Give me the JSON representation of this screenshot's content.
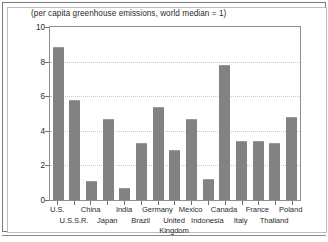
{
  "chart_data": {
    "type": "bar",
    "title": "(per capita greenhouse emissions, world median = 1)",
    "xlabel": "",
    "ylabel": "",
    "ylim": [
      0,
      10
    ],
    "ytick_labels": [
      "0",
      "2",
      "4",
      "6",
      "8",
      "10"
    ],
    "ytick_values": [
      0,
      2,
      4,
      6,
      8,
      10
    ],
    "grid": true,
    "grid_axis": "y",
    "legend": false,
    "bar_color": "#828282",
    "categories": [
      "U.S.",
      "U.S.S.R.",
      "China",
      "Japan",
      "India",
      "Brazil",
      "Germany",
      "United Kingdom",
      "Mexico",
      "Indonesia",
      "Canada",
      "Italy",
      "France",
      "Thailand",
      "Poland"
    ],
    "values": [
      8.85,
      5.8,
      1.1,
      4.7,
      0.7,
      3.3,
      5.4,
      2.9,
      4.7,
      1.2,
      7.8,
      3.4,
      3.4,
      3.3,
      4.8
    ],
    "label_rows": [
      {
        "row": 0,
        "labels": [
          "U.S.",
          "China",
          "India",
          "Germany",
          "Mexico",
          "Canada",
          "France",
          "Poland"
        ],
        "indices": [
          0,
          2,
          4,
          6,
          8,
          10,
          12,
          14
        ]
      },
      {
        "row": 1,
        "labels": [
          "U.S.S.R.",
          "Japan",
          "Brazil",
          "United",
          "Indonesia",
          "Italy",
          "Thailand"
        ],
        "indices": [
          1,
          3,
          5,
          7,
          9,
          11,
          13
        ]
      },
      {
        "row": 2,
        "labels": [
          "Kingdom"
        ],
        "indices": [
          7
        ]
      }
    ]
  }
}
